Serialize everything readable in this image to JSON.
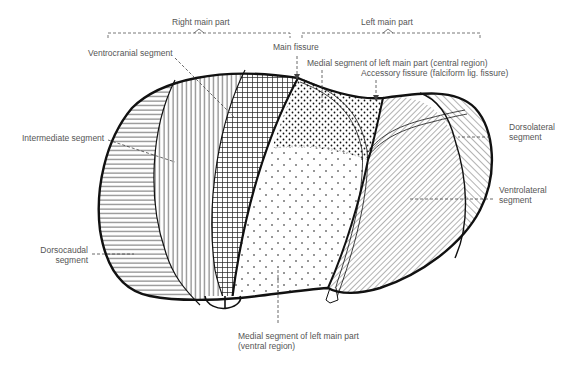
{
  "diagram": {
    "type": "anatomical-liver-segments",
    "brackets": {
      "right_main_part": "Right main part",
      "left_main_part": "Left main part"
    },
    "labels": {
      "main_fissure": "Main fissure",
      "ventrocranial": "Ventrocranial segment",
      "intermediate": "Intermediate segment",
      "dorsocaudal_1": "Dorsocaudal",
      "dorsocaudal_2": "segment",
      "medial_central": "Medial segment of left main part (central region)",
      "accessory_fissure": "Accessory fissure (falciform lig. fissure)",
      "dorsolateral_1": "Dorsolateral",
      "dorsolateral_2": "segment",
      "ventrolateral_1": "Ventrolateral",
      "ventrolateral_2": "segment",
      "medial_ventral_1": "Medial segment of left main part",
      "medial_ventral_2": "(ventral region)"
    },
    "segments": [
      {
        "name": "Dorsocaudal segment",
        "pattern": "horizontal-lines"
      },
      {
        "name": "Intermediate segment",
        "pattern": "vertical-lines"
      },
      {
        "name": "Ventrocranial segment",
        "pattern": "grid"
      },
      {
        "name": "Medial segment of left main part (central region)",
        "pattern": "dense-dots"
      },
      {
        "name": "Medial segment of left main part (ventral region)",
        "pattern": "sparse-dots"
      },
      {
        "name": "Ventrolateral segment",
        "pattern": "diagonal-lines-left"
      },
      {
        "name": "Dorsolateral segment",
        "pattern": "diagonal-lines-right"
      }
    ],
    "colors": {
      "ink": "#111111",
      "label": "#555555",
      "background": "#ffffff"
    }
  }
}
